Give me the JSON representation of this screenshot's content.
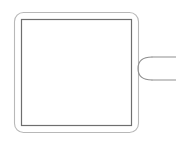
{
  "canvas": {
    "width": 176,
    "height": 147,
    "background_color": "#ffffff",
    "title": "Square panel with side connector"
  },
  "shapes": {
    "outer_frame": {
      "name": "rounded-square-outline",
      "x": 14,
      "y": 12,
      "width": 125,
      "height": 121,
      "corner_radius": 9,
      "stroke_color": "#b8b8b8",
      "stroke_width": 1.1,
      "fill": "none"
    },
    "inner_frame": {
      "name": "square-outline",
      "x": 21,
      "y": 19,
      "width": 111,
      "height": 107,
      "corner_radius": 0,
      "stroke_color": "#6e6e6e",
      "stroke_width": 1.2,
      "fill": "#ffffff"
    },
    "connector": {
      "name": "c-hook",
      "description": "semicircular hook opening to the right on the panel's right edge",
      "attach_x": 139,
      "top_y": 57,
      "bottom_y": 80,
      "bulge_x": 152,
      "stroke_color": "#8f8f8f",
      "stroke_width": 1.1,
      "path": "M 152 57 C 142 57 138 62 138 68.5 C 138 75 142 80 152 80"
    },
    "lead_top": {
      "name": "lead-line-top",
      "x1": 152,
      "y1": 57,
      "x2": 176,
      "y2": 57,
      "stroke_color": "#8f8f8f",
      "stroke_width": 1.1
    },
    "lead_bottom": {
      "name": "lead-line-bottom",
      "x1": 152,
      "y1": 80,
      "x2": 176,
      "y2": 80,
      "stroke_color": "#8f8f8f",
      "stroke_width": 1.1
    }
  },
  "labels": {
    "interior_text": "",
    "caption": ""
  }
}
